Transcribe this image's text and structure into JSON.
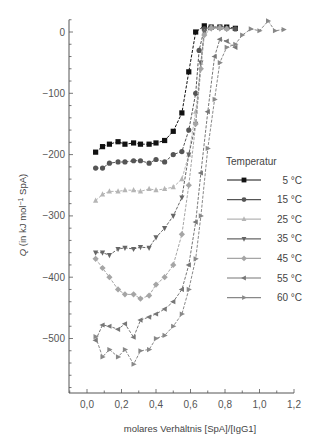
{
  "chart_data": {
    "type": "line",
    "title": "",
    "xlabel": "molares Verhältnis [SpA]/[IgG1]",
    "ylabel_italic": "Q",
    "ylabel_rest": " (in kJ mol",
    "ylabel_sup": "−1",
    "ylabel_end": " SpA)",
    "xlim": [
      -0.1,
      1.2
    ],
    "ylim": [
      -580,
      20
    ],
    "xticks": [
      0.0,
      0.2,
      0.4,
      0.6,
      0.8,
      1.0,
      1.2
    ],
    "xtick_labels": [
      "0,0",
      "0,2",
      "0,4",
      "0,6",
      "0,8",
      "1,0",
      "1,2"
    ],
    "yticks": [
      0,
      -100,
      -200,
      -300,
      -400,
      -500
    ],
    "ytick_labels": [
      "0",
      "−100",
      "−200",
      "−300",
      "−400",
      "−500"
    ],
    "legend": {
      "title": "Temperatur",
      "position": "right-middle"
    },
    "grid": false,
    "series": [
      {
        "name": "5 °C",
        "marker": "square",
        "color": "#111111",
        "x": [
          0.05,
          0.09,
          0.13,
          0.18,
          0.22,
          0.27,
          0.31,
          0.36,
          0.4,
          0.45,
          0.5,
          0.55,
          0.59,
          0.63,
          0.68,
          0.72,
          0.77,
          0.81,
          0.86
        ],
        "y": [
          -196,
          -187,
          -183,
          -179,
          -183,
          -181,
          -183,
          -183,
          -181,
          -177,
          -162,
          -132,
          -65,
          0,
          10,
          8,
          8,
          8,
          6
        ]
      },
      {
        "name": "15 °C",
        "marker": "circle",
        "color": "#555555",
        "x": [
          0.05,
          0.09,
          0.13,
          0.18,
          0.22,
          0.27,
          0.31,
          0.36,
          0.4,
          0.45,
          0.5,
          0.55,
          0.59,
          0.63,
          0.65,
          0.68,
          0.72,
          0.77,
          0.81,
          0.86
        ],
        "y": [
          -222,
          -222,
          -214,
          -212,
          -212,
          -210,
          -210,
          -214,
          -208,
          -212,
          -200,
          -195,
          -160,
          -100,
          -30,
          5,
          8,
          8,
          6,
          5
        ]
      },
      {
        "name": "25 °C",
        "marker": "triangle-up",
        "color": "#b5b5b5",
        "x": [
          0.05,
          0.09,
          0.13,
          0.18,
          0.22,
          0.27,
          0.31,
          0.36,
          0.4,
          0.45,
          0.5,
          0.55,
          0.59,
          0.63,
          0.66,
          0.68,
          0.72,
          0.77,
          0.81
        ],
        "y": [
          -275,
          -265,
          -260,
          -260,
          -258,
          -258,
          -260,
          -256,
          -258,
          -256,
          -253,
          -240,
          -200,
          -130,
          -50,
          0,
          8,
          8,
          6
        ]
      },
      {
        "name": "35 °C",
        "marker": "triangle-down",
        "color": "#666666",
        "x": [
          0.05,
          0.09,
          0.13,
          0.18,
          0.22,
          0.27,
          0.31,
          0.36,
          0.4,
          0.45,
          0.5,
          0.55,
          0.59,
          0.63,
          0.66,
          0.68,
          0.72,
          0.77,
          0.81
        ],
        "y": [
          -360,
          -360,
          -364,
          -354,
          -352,
          -354,
          -351,
          -352,
          -335,
          -320,
          -300,
          -270,
          -200,
          -150,
          -50,
          0,
          6,
          6,
          5
        ]
      },
      {
        "name": "45 °C",
        "marker": "diamond",
        "color": "#a5a5a5",
        "x": [
          0.05,
          0.09,
          0.13,
          0.18,
          0.22,
          0.27,
          0.31,
          0.36,
          0.4,
          0.45,
          0.5,
          0.55,
          0.59,
          0.63,
          0.66,
          0.68,
          0.72,
          0.77,
          0.81
        ],
        "y": [
          -370,
          -385,
          -400,
          -420,
          -428,
          -428,
          -435,
          -430,
          -412,
          -400,
          -380,
          -330,
          -250,
          -150,
          -60,
          -5,
          6,
          6,
          5
        ]
      },
      {
        "name": "55 °C",
        "marker": "triangle-left",
        "color": "#777777",
        "x": [
          0.05,
          0.09,
          0.13,
          0.18,
          0.22,
          0.27,
          0.31,
          0.36,
          0.4,
          0.45,
          0.5,
          0.55,
          0.59,
          0.63,
          0.66,
          0.7,
          0.74,
          0.77,
          0.81,
          0.86
        ],
        "y": [
          -503,
          -478,
          -480,
          -485,
          -476,
          -498,
          -470,
          -465,
          -460,
          -452,
          -440,
          -420,
          -380,
          -310,
          -230,
          -130,
          -40,
          -12,
          -15,
          -25
        ]
      },
      {
        "name": "60 °C",
        "marker": "triangle-right",
        "color": "#888888",
        "x": [
          0.05,
          0.09,
          0.13,
          0.18,
          0.22,
          0.27,
          0.31,
          0.36,
          0.4,
          0.45,
          0.5,
          0.55,
          0.59,
          0.63,
          0.66,
          0.7,
          0.74,
          0.77,
          0.81,
          0.86,
          0.9,
          0.95,
          1.0,
          1.05,
          1.09,
          1.14
        ],
        "y": [
          -497,
          -530,
          -518,
          -530,
          -518,
          -542,
          -520,
          -518,
          -500,
          -495,
          -480,
          -460,
          -420,
          -370,
          -300,
          -190,
          -110,
          -50,
          -25,
          -20,
          -5,
          5,
          2,
          18,
          2,
          4
        ]
      }
    ]
  }
}
